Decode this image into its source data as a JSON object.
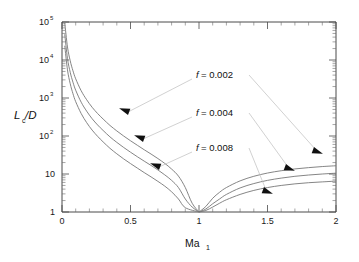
{
  "chart_data": {
    "type": "line",
    "title": "",
    "subtitle": "",
    "xlabel": "Ma",
    "xlabel_sub": "1",
    "ylabel_main": "L",
    "ylabel_sub": "c",
    "ylabel_tail": "/D",
    "ylabel_full": "Lc/D",
    "xlim": [
      0,
      2
    ],
    "ylim": [
      1,
      100000
    ],
    "yscale": "log",
    "xscale": "linear",
    "grid": false,
    "legend_position": "inline-annotations",
    "xticks": [
      {
        "value": 0,
        "label": "0"
      },
      {
        "value": 0.5,
        "label": "0.5"
      },
      {
        "value": 1,
        "label": "1"
      },
      {
        "value": 1.5,
        "label": "1.5"
      },
      {
        "value": 2,
        "label": "2"
      }
    ],
    "yticks": [
      {
        "value": 1,
        "label": "1",
        "mantissa": "1",
        "exponent": ""
      },
      {
        "value": 10,
        "label": "10",
        "mantissa": "10",
        "exponent": ""
      },
      {
        "value": 100,
        "label": "10^2",
        "mantissa": "10",
        "exponent": "2"
      },
      {
        "value": 1000,
        "label": "10^3",
        "mantissa": "10",
        "exponent": "3"
      },
      {
        "value": 10000,
        "label": "10^4",
        "mantissa": "10",
        "exponent": "4"
      },
      {
        "value": 100000,
        "label": "10^5",
        "mantissa": "10",
        "exponent": "5"
      }
    ],
    "annotations": [
      {
        "text_italic": "f",
        "text": " = 0.002",
        "x_px": 196,
        "y_px": 78
      },
      {
        "text_italic": "f",
        "text": " = 0.004",
        "x_px": 196,
        "y_px": 116
      },
      {
        "text_italic": "f",
        "text": " = 0.008",
        "x_px": 196,
        "y_px": 151
      }
    ],
    "series": [
      {
        "name": "f = 0.002",
        "friction_factor": 0.002,
        "branch_subsonic": {
          "x": [
            0.02,
            0.04,
            0.06,
            0.08,
            0.1,
            0.14,
            0.18,
            0.22,
            0.26,
            0.3,
            0.35,
            0.4,
            0.45,
            0.5,
            0.55,
            0.6,
            0.65,
            0.7,
            0.75,
            0.8,
            0.85,
            0.9,
            0.95,
            1.0
          ],
          "y": [
            95000,
            22000,
            9500,
            5200,
            3200,
            1550,
            900,
            570,
            390,
            280,
            190,
            136,
            100,
            75,
            57,
            43.5,
            33.5,
            25.5,
            19,
            13.5,
            8.8,
            4.4,
            1.7,
            1.0
          ]
        },
        "branch_supersonic": {
          "x": [
            1.0,
            1.05,
            1.1,
            1.15,
            1.2,
            1.3,
            1.4,
            1.5,
            1.6,
            1.7,
            1.8,
            1.9,
            2.0
          ],
          "y": [
            1.0,
            1.4,
            2.3,
            3.3,
            4.4,
            6.6,
            8.7,
            10.6,
            12.2,
            13.6,
            14.7,
            15.7,
            16.5
          ]
        }
      },
      {
        "name": "f = 0.004",
        "friction_factor": 0.004,
        "branch_subsonic": {
          "x": [
            0.02,
            0.04,
            0.06,
            0.08,
            0.1,
            0.14,
            0.18,
            0.22,
            0.26,
            0.3,
            0.35,
            0.4,
            0.45,
            0.5,
            0.55,
            0.6,
            0.65,
            0.7,
            0.75,
            0.8,
            0.85,
            0.9,
            0.95,
            1.0
          ],
          "y": [
            47500,
            11000,
            4750,
            2600,
            1600,
            775,
            450,
            285,
            195,
            140,
            95,
            68,
            50,
            37.5,
            28.5,
            21.8,
            16.8,
            12.8,
            9.5,
            6.8,
            4.4,
            2.2,
            1.35,
            1.0
          ]
        },
        "branch_supersonic": {
          "x": [
            1.0,
            1.05,
            1.1,
            1.15,
            1.2,
            1.3,
            1.4,
            1.5,
            1.6,
            1.7,
            1.8,
            1.9,
            2.0
          ],
          "y": [
            1.0,
            1.2,
            1.65,
            2.2,
            2.9,
            4.3,
            5.6,
            6.8,
            7.8,
            8.7,
            9.4,
            10.0,
            10.5
          ]
        }
      },
      {
        "name": "f = 0.008",
        "friction_factor": 0.008,
        "branch_subsonic": {
          "x": [
            0.02,
            0.04,
            0.06,
            0.08,
            0.1,
            0.14,
            0.18,
            0.22,
            0.26,
            0.3,
            0.35,
            0.4,
            0.45,
            0.5,
            0.55,
            0.6,
            0.65,
            0.7,
            0.75,
            0.8,
            0.85,
            0.9,
            1.0
          ],
          "y": [
            23750,
            5500,
            2375,
            1300,
            800,
            390,
            225,
            143,
            98,
            70,
            47.5,
            34,
            25,
            18.8,
            14.3,
            10.9,
            8.4,
            6.4,
            4.8,
            3.4,
            2.2,
            1.3,
            1.0
          ]
        },
        "branch_supersonic": {
          "x": [
            1.0,
            1.05,
            1.1,
            1.15,
            1.2,
            1.3,
            1.4,
            1.5,
            1.6,
            1.7,
            1.8,
            1.9,
            2.0
          ],
          "y": [
            1.0,
            1.1,
            1.35,
            1.7,
            2.1,
            2.9,
            3.7,
            4.4,
            5.0,
            5.5,
            5.9,
            6.2,
            6.5
          ]
        }
      }
    ],
    "markers": [
      {
        "series": "f = 0.002",
        "branch": "subsonic",
        "x_px": 124,
        "y_px": 110,
        "rotation": 200
      },
      {
        "series": "f = 0.004",
        "branch": "subsonic",
        "x_px": 139,
        "y_px": 137,
        "rotation": 200
      },
      {
        "series": "f = 0.008",
        "branch": "subsonic",
        "x_px": 155,
        "y_px": 165,
        "rotation": 200
      },
      {
        "series": "f = 0.002",
        "branch": "supersonic",
        "x_px": 318,
        "y_px": 152,
        "rotation": 20
      },
      {
        "series": "f = 0.004",
        "branch": "supersonic",
        "x_px": 290,
        "y_px": 169,
        "rotation": 20
      },
      {
        "series": "f = 0.008",
        "branch": "supersonic",
        "x_px": 268,
        "y_px": 192,
        "rotation": 20
      }
    ],
    "colors": {
      "curve": "#777777",
      "axis": "#4a4a4a",
      "marker": "#101010",
      "leader": "#bdbdbd",
      "background": "#ffffff",
      "text": "#1a1a1a"
    }
  }
}
